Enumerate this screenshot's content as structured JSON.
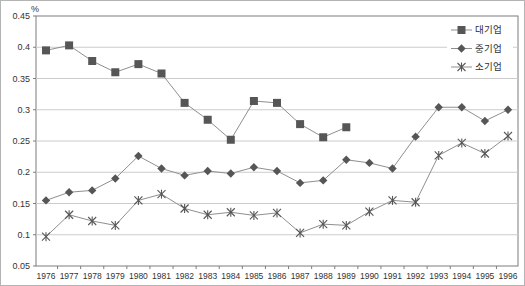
{
  "chart_data": {
    "type": "line",
    "title": "",
    "unit_label": "%",
    "x": [
      "1976",
      "1977",
      "1978",
      "1979",
      "1980",
      "1981",
      "1982",
      "1983",
      "1984",
      "1985",
      "1986",
      "1987",
      "1988",
      "1989",
      "1990",
      "1991",
      "1992",
      "1993",
      "1994",
      "1995",
      "1996"
    ],
    "xlabel": "",
    "ylabel": "%",
    "ylim": [
      0.05,
      0.45
    ],
    "grid": "horizontal",
    "legend_position": "top-right-inside",
    "y_ticks": {
      "values": [
        0.45,
        0.4,
        0.35,
        0.3,
        0.25,
        0.2,
        0.15,
        0.1,
        0.05
      ],
      "labels": [
        "0.45",
        "0.4",
        "0.35",
        "0.3",
        "0.25",
        "0.2",
        "0.15",
        "0.1",
        "0.05"
      ]
    },
    "series": [
      {
        "name": "대기업",
        "marker": "square",
        "values": [
          0.395,
          0.403,
          0.378,
          0.36,
          0.373,
          0.358,
          0.311,
          0.284,
          0.252,
          0.314,
          0.311,
          0.277,
          0.256,
          0.272,
          null,
          null,
          null,
          null,
          null,
          null,
          null
        ]
      },
      {
        "name": "중기업",
        "marker": "diamond",
        "values": [
          0.155,
          0.168,
          0.171,
          0.19,
          0.226,
          0.206,
          0.195,
          0.202,
          0.198,
          0.208,
          0.202,
          0.183,
          0.187,
          0.22,
          0.215,
          0.206,
          0.257,
          0.304,
          0.304,
          0.282,
          0.3
        ]
      },
      {
        "name": "소기업",
        "marker": "asterisk",
        "values": [
          0.097,
          0.132,
          0.122,
          0.115,
          0.155,
          0.165,
          0.142,
          0.132,
          0.136,
          0.131,
          0.135,
          0.103,
          0.117,
          0.115,
          0.137,
          0.155,
          0.152,
          0.227,
          0.247,
          0.23,
          0.258
        ]
      }
    ],
    "colors": {
      "background": "#ffffff",
      "line": "#8f8f8f",
      "marker": "#565656",
      "grid": "#cccccc",
      "axis": "#7d7d7d",
      "text": "#333333"
    }
  }
}
